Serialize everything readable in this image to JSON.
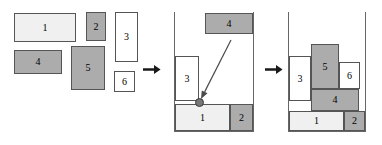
{
  "figure": {
    "background": "#ffffff",
    "colors": {
      "fill_gray": "#acacac",
      "fill_light": "#f0f0f0",
      "fill_white": "#ffffff",
      "stroke": "#555555",
      "bin_stroke": "#666666",
      "arrow": "#1a1a1a",
      "anchor_dot": "#777777"
    }
  },
  "panels": [
    {
      "id": "input-set",
      "name": "unpacked-rectangles",
      "rects": [
        {
          "label": "1",
          "x": 14,
          "y": 13,
          "w": 62,
          "h": 29,
          "fill": "light"
        },
        {
          "label": "2",
          "x": 86,
          "y": 12,
          "w": 20,
          "h": 29,
          "fill": "gray"
        },
        {
          "label": "3",
          "x": 115,
          "y": 12,
          "w": 23,
          "h": 50,
          "fill": "white"
        },
        {
          "label": "4",
          "x": 14,
          "y": 50,
          "w": 48,
          "h": 24,
          "fill": "gray"
        },
        {
          "label": "5",
          "x": 71,
          "y": 46,
          "w": 34,
          "h": 44,
          "fill": "gray"
        },
        {
          "label": "6",
          "x": 114,
          "y": 71,
          "w": 21,
          "h": 21,
          "fill": "white"
        }
      ]
    },
    {
      "id": "partial-packing",
      "name": "packing-in-progress",
      "bin": {
        "x": 174,
        "y": 12,
        "w": 80,
        "h": 120
      },
      "rects": [
        {
          "label": "3",
          "x": 175,
          "y": 56,
          "w": 24,
          "h": 45,
          "fill": "white"
        },
        {
          "label": "1",
          "x": 175,
          "y": 104,
          "w": 55,
          "h": 27,
          "fill": "light"
        },
        {
          "label": "2",
          "x": 230,
          "y": 104,
          "w": 23,
          "h": 27,
          "fill": "gray"
        },
        {
          "label": "4",
          "x": 205,
          "y": 13,
          "w": 48,
          "h": 21,
          "fill": "gray"
        }
      ],
      "anchor": {
        "x": 199,
        "y": 102
      },
      "placement_arrow": {
        "x1": 231,
        "y1": 40,
        "x2": 201,
        "y2": 99
      }
    },
    {
      "id": "final-packing",
      "name": "packing-complete",
      "bin": {
        "x": 288,
        "y": 12,
        "w": 78,
        "h": 120
      },
      "rects": [
        {
          "label": "3",
          "x": 289,
          "y": 56,
          "w": 22,
          "h": 45,
          "fill": "white"
        },
        {
          "label": "5",
          "x": 311,
          "y": 44,
          "w": 28,
          "h": 45,
          "fill": "gray"
        },
        {
          "label": "6",
          "x": 339,
          "y": 62,
          "w": 21,
          "h": 27,
          "fill": "white"
        },
        {
          "label": "4",
          "x": 311,
          "y": 89,
          "w": 48,
          "h": 22,
          "fill": "gray"
        },
        {
          "label": "1",
          "x": 289,
          "y": 111,
          "w": 55,
          "h": 20,
          "fill": "light"
        },
        {
          "label": "2",
          "x": 344,
          "y": 111,
          "w": 21,
          "h": 20,
          "fill": "gray"
        }
      ]
    }
  ],
  "step_arrows": [
    {
      "name": "step-arrow-1",
      "x": 143,
      "y": 64
    },
    {
      "name": "step-arrow-2",
      "x": 265,
      "y": 64
    }
  ]
}
